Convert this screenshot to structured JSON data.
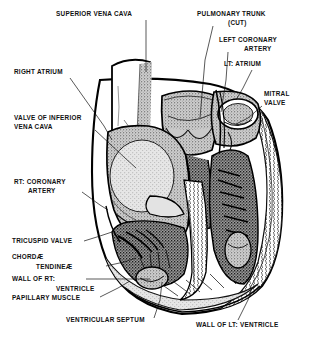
{
  "figure": {
    "background": "#ffffff",
    "ink": "#111111",
    "width": 316,
    "height": 340
  },
  "labels": [
    {
      "id": "superior-vena-cava",
      "text": "SUPERIOR VENA CAVA",
      "lines": [
        "SUPERIOR VENA CAVA"
      ],
      "x": 56,
      "y": 16,
      "align": "start",
      "leader": [
        [
          146,
          20
        ],
        [
          146,
          72
        ]
      ]
    },
    {
      "id": "pulmonary-trunk",
      "text": "PULMONARY TRUNK (CUT)",
      "lines": [
        "PULMONARY TRUNK",
        "(CUT)"
      ],
      "x": 197,
      "y": 16,
      "align": "start",
      "leader": [
        [
          213,
          26
        ],
        [
          205,
          60
        ],
        [
          200,
          118
        ]
      ]
    },
    {
      "id": "left-coronary-artery",
      "text": "LEFT CORONARY ARTERY",
      "lines": [
        "LEFT CORONARY",
        "ARTERY"
      ],
      "x": 219,
      "y": 42,
      "align": "start",
      "leader": [
        [
          228,
          52
        ],
        [
          226,
          80
        ],
        [
          221,
          112
        ]
      ]
    },
    {
      "id": "left-atrium",
      "text": "LT: ATRIUM",
      "lines": [
        "LT: ATRIUM"
      ],
      "x": 224,
      "y": 66,
      "align": "start",
      "leader": [
        [
          252,
          70
        ],
        [
          243,
          88
        ],
        [
          236,
          100
        ]
      ]
    },
    {
      "id": "mitral-valve",
      "text": "MITRAL VALVE",
      "lines": [
        "MITRAL",
        "VALVE"
      ],
      "x": 264,
      "y": 96,
      "align": "start",
      "leader": [
        [
          262,
          106
        ],
        [
          248,
          118
        ],
        [
          236,
          124
        ]
      ]
    },
    {
      "id": "right-atrium",
      "text": "RIGHT ATRIUM",
      "lines": [
        "RIGHT ATRIUM"
      ],
      "x": 14,
      "y": 74,
      "align": "start",
      "leader": [
        [
          70,
          78
        ],
        [
          104,
          126
        ],
        [
          112,
          140
        ]
      ]
    },
    {
      "id": "valve-inferior-vena-cava",
      "text": "VALVE OF INFERIOR VENA CAVA",
      "lines": [
        "VALVE OF INFERIOR",
        "VENA CAVA"
      ],
      "x": 14,
      "y": 120,
      "align": "start",
      "leader": [
        [
          95,
          130
        ],
        [
          125,
          158
        ],
        [
          136,
          168
        ]
      ]
    },
    {
      "id": "right-coronary-artery",
      "text": "RT: CORONARY ARTERY",
      "lines": [
        "RT: CORONARY",
        "ARTERY"
      ],
      "x": 14,
      "y": 184,
      "align": "start",
      "leader": [
        [
          82,
          192
        ],
        [
          100,
          205
        ],
        [
          108,
          210
        ]
      ]
    },
    {
      "id": "tricuspid-valve",
      "text": "TRICUSPID VALVE",
      "lines": [
        "TRICUSPID VALVE"
      ],
      "x": 12,
      "y": 243,
      "align": "start",
      "leader": [
        [
          84,
          241
        ],
        [
          100,
          236
        ],
        [
          112,
          232
        ]
      ]
    },
    {
      "id": "chordae-tendineae",
      "text": "CHORDÆ TENDINEÆ",
      "lines": [
        "CHORDÆ",
        "TENDINEÆ"
      ],
      "x": 12,
      "y": 259,
      "align": "start",
      "leader": [
        [
          106,
          266
        ],
        [
          124,
          262
        ],
        [
          136,
          258
        ]
      ]
    },
    {
      "id": "wall-of-right-ventricle",
      "text": "WALL OF RT: VENTRICLE",
      "lines": [
        "WALL OF RT:",
        "VENTRICLE"
      ],
      "x": 12,
      "y": 281,
      "align": "start",
      "leader": [
        [
          86,
          279
        ],
        [
          150,
          279
        ]
      ]
    },
    {
      "id": "papillary-muscle",
      "text": "PAPILLARY MUSCLE",
      "lines": [
        "PAPILLARY MUSCLE"
      ],
      "x": 12,
      "y": 300,
      "align": "start",
      "leader": [
        [
          100,
          297
        ],
        [
          118,
          288
        ],
        [
          130,
          281
        ]
      ]
    },
    {
      "id": "ventricular-septum",
      "text": "VENTRICULAR SEPTUM",
      "lines": [
        "VENTRICULAR SEPTUM"
      ],
      "x": 66,
      "y": 322,
      "align": "start",
      "leader": [
        [
          154,
          318
        ],
        [
          160,
          300
        ],
        [
          162,
          282
        ]
      ]
    },
    {
      "id": "wall-of-left-ventricle",
      "text": "WALL OF LT: VENTRICLE",
      "lines": [
        "WALL OF LT: VENTRICLE"
      ],
      "x": 196,
      "y": 327,
      "align": "start",
      "leader": [
        [
          238,
          320
        ],
        [
          248,
          300
        ],
        [
          252,
          288
        ]
      ]
    }
  ],
  "structures": [
    {
      "id": "superior-vena-cava-vessel",
      "name": "Superior vena cava"
    },
    {
      "id": "pulmonary-trunk-vessel",
      "name": "Pulmonary trunk (cut)"
    },
    {
      "id": "right-atrium-chamber",
      "name": "Right atrium"
    },
    {
      "id": "left-atrium-chamber",
      "name": "Left atrium"
    },
    {
      "id": "right-ventricle-chamber",
      "name": "Right ventricle"
    },
    {
      "id": "left-ventricle-chamber",
      "name": "Left ventricle"
    },
    {
      "id": "interventricular-septum",
      "name": "Ventricular septum"
    },
    {
      "id": "mitral-valve-structure",
      "name": "Mitral valve"
    },
    {
      "id": "tricuspid-valve-structure",
      "name": "Tricuspid valve"
    },
    {
      "id": "pulmonary-valve-cusps",
      "name": "Pulmonary valve cusps"
    },
    {
      "id": "papillary-muscle-structure",
      "name": "Papillary muscle"
    },
    {
      "id": "chordae-tendineae-structure",
      "name": "Chordae tendineae"
    }
  ]
}
